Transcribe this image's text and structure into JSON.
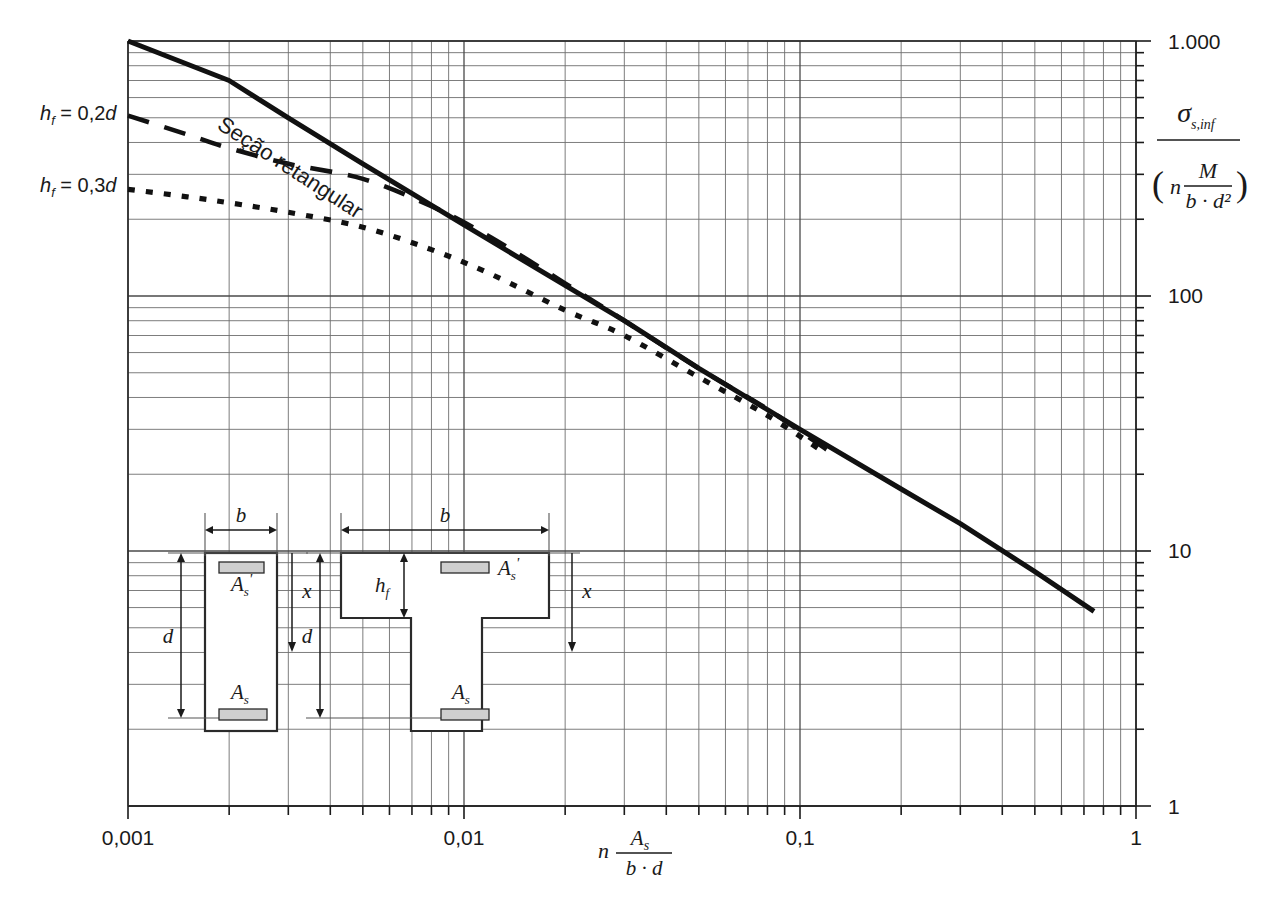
{
  "chart_data": {
    "type": "line",
    "title": "",
    "xlabel": "n As/(b·d)",
    "ylabel": "sigma_s,inf / ( n M/(b·d^2) )",
    "xscale": "log",
    "yscale": "log",
    "xlim": [
      0.001,
      1
    ],
    "ylim": [
      1,
      1000
    ],
    "grid": true,
    "legend_position": "in-plot-annotations",
    "x_tick_labels": [
      "0,001",
      "0,01",
      "0,1",
      "1"
    ],
    "x_tick_values": [
      0.001,
      0.01,
      0.1,
      1
    ],
    "y_tick_labels": [
      "1.000",
      "100",
      "10",
      "1"
    ],
    "y_tick_values": [
      1000,
      100,
      10,
      1
    ],
    "series": [
      {
        "name": "Seção retangular",
        "style": "solid",
        "points": [
          [
            0.001,
            1250
          ],
          [
            0.002,
            700
          ],
          [
            0.003,
            500
          ],
          [
            0.005,
            330
          ],
          [
            0.01,
            190
          ],
          [
            0.02,
            110
          ],
          [
            0.03,
            80
          ],
          [
            0.05,
            52
          ],
          [
            0.1,
            30
          ],
          [
            0.2,
            17.5
          ],
          [
            0.3,
            12.8
          ],
          [
            0.5,
            8.3
          ],
          [
            0.75,
            5.8
          ]
        ]
      },
      {
        "name": "h_f = 0,2d",
        "style": "dashed",
        "points": [
          [
            0.001,
            510
          ],
          [
            0.0015,
            430
          ],
          [
            0.002,
            380
          ],
          [
            0.003,
            330
          ],
          [
            0.005,
            288
          ],
          [
            0.008,
            225
          ],
          [
            0.012,
            170
          ],
          [
            0.02,
            112
          ],
          [
            0.03,
            80
          ],
          [
            0.05,
            52
          ],
          [
            0.08,
            36
          ],
          [
            0.12,
            25
          ]
        ]
      },
      {
        "name": "h_f = 0,3d",
        "style": "dotted",
        "points": [
          [
            0.001,
            262
          ],
          [
            0.0015,
            245
          ],
          [
            0.002,
            232
          ],
          [
            0.003,
            213
          ],
          [
            0.005,
            186
          ],
          [
            0.008,
            152
          ],
          [
            0.012,
            122
          ],
          [
            0.02,
            88
          ],
          [
            0.03,
            70
          ],
          [
            0.05,
            48
          ],
          [
            0.08,
            34
          ],
          [
            0.12,
            24
          ]
        ]
      }
    ],
    "annotations": [
      {
        "name": "hf-02d-label",
        "text": "h",
        "sub": "f",
        "rest": " = 0,2d"
      },
      {
        "name": "hf-03d-label",
        "text": "h",
        "sub": "f",
        "rest": " = 0,3d"
      },
      {
        "name": "rect-section-label",
        "text": "Seção retangular",
        "rotation": 33
      }
    ]
  },
  "axes": {
    "x": {
      "ticks": [
        {
          "label": "0,001",
          "value": 0.001
        },
        {
          "label": "0,01",
          "value": 0.01
        },
        {
          "label": "0,1",
          "value": 0.1
        },
        {
          "label": "1",
          "value": 1
        }
      ],
      "title": {
        "lead": "n",
        "numerator": "A",
        "numerator_sub": "s",
        "denominator": "b · d"
      }
    },
    "y": {
      "ticks": [
        {
          "label": "1.000",
          "value": 1000
        },
        {
          "label": "100",
          "value": 100
        },
        {
          "label": "10",
          "value": 10
        },
        {
          "label": "1",
          "value": 1
        }
      ],
      "title": {
        "numerator": "σ",
        "numerator_sub": "s,inf",
        "denominator_lead": "n",
        "denominator_num": "M",
        "denominator_den": "b · d²",
        "open_paren": "(",
        "close_paren": ")"
      }
    }
  },
  "curve_labels": {
    "hf_02d": {
      "sym": "h",
      "sub": "f",
      "eq": " = 0,2",
      "unit": "d"
    },
    "hf_03d": {
      "sym": "h",
      "sub": "f",
      "eq": " = 0,3",
      "unit": "d"
    },
    "rect_section": "Seção retangular"
  },
  "diagrams": {
    "rectangular": {
      "name": "rectangular-section",
      "labels": {
        "width": "b",
        "depth": "d",
        "neutral_axis": "x",
        "top_steel": "A",
        "top_steel_sub": "s",
        "top_steel_prime": "'",
        "bottom_steel": "A",
        "bottom_steel_sub": "s"
      }
    },
    "tee": {
      "name": "tee-section",
      "labels": {
        "width": "b",
        "depth": "d",
        "flange": "h",
        "flange_sub": "f",
        "neutral_axis": "x",
        "top_steel": "A",
        "top_steel_sub": "s",
        "top_steel_prime": "'",
        "bottom_steel": "A",
        "bottom_steel_sub": "s"
      }
    }
  },
  "colors": {
    "ink": "#1a1a1a",
    "grid": "#6e6e6e",
    "frame": "#3a3a3a",
    "rebar_fill": "#cfcfcf",
    "background": "#ffffff"
  }
}
